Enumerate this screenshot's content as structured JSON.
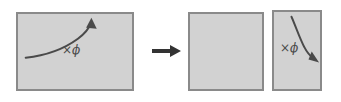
{
  "figure": {
    "background_color": "#ffffff",
    "width": 341,
    "height": 102
  },
  "colors": {
    "panel_fill": "#d2d2d2",
    "panel_border": "#8a8a8a",
    "curve_stroke": "#4a4a4a",
    "transform_arrow": "#333333",
    "label_text": "#4a4a4a"
  },
  "panels": [
    {
      "id": "source",
      "role": "source-region",
      "label": "×ϕ",
      "label_icon": "multiply-phi-label",
      "curve": {
        "direction": "up-right",
        "arrowhead": "top-right",
        "path": "M 8 46 C 26 44 46 38 62 26 C 70 20 74 14 76 9",
        "head_points": "76,4 81.5,15.5 70.5,14.5"
      },
      "geometry": {
        "left": 16,
        "top": 12,
        "width": 118,
        "height": 79
      }
    },
    {
      "id": "result-a",
      "role": "result-region-empty",
      "label": "",
      "curve": null,
      "geometry": {
        "left": 188,
        "top": 12,
        "width": 76,
        "height": 79
      }
    },
    {
      "id": "result-b",
      "role": "result-region-scaled",
      "label": "×ϕ",
      "label_icon": "multiply-phi-label",
      "curve": {
        "direction": "down-right",
        "arrowhead": "bottom-right",
        "path": "M 19 5 C 24 16 28 28 33 37 C 36 43 40 47 44 50",
        "head_points": "49,53 37.5,50 41,41.5"
      },
      "geometry": {
        "left": 272,
        "top": 10,
        "width": 50,
        "height": 81
      }
    }
  ],
  "transform_arrow": {
    "icon": "right-arrow-icon",
    "direction": "right",
    "label": ""
  }
}
